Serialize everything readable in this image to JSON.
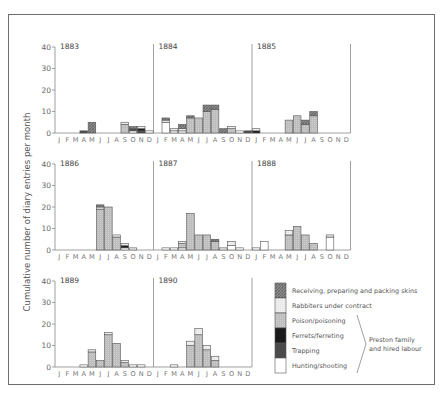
{
  "figure": {
    "ylabel": "Cumulative number of diary entries per month",
    "months": [
      "J",
      "F",
      "M",
      "A",
      "M",
      "J",
      "J",
      "A",
      "S",
      "O",
      "N",
      "D"
    ],
    "yticks": [
      0,
      10,
      20,
      30,
      40
    ]
  },
  "colors": {
    "receiving": "#7a7a7a",
    "rabbiters": "#eeeeee",
    "poison": "#c4c4c4",
    "ferrets": "#1a1a1a",
    "trapping": "#4a4a4a",
    "hunting": "#ffffff",
    "outline": "#555555",
    "axis": "#888888"
  },
  "legend": {
    "items": [
      {
        "key": "receiving",
        "label": "Receiving, preparing and packing skins"
      },
      {
        "key": "rabbiters",
        "label": "Rabbiters under contract"
      },
      {
        "key": "poison",
        "label": "Poison/poisoning"
      },
      {
        "key": "ferrets",
        "label": "Ferrets/ferreting"
      },
      {
        "key": "trapping",
        "label": "Trapping"
      },
      {
        "key": "hunting",
        "label": "Hunting/shooting"
      }
    ],
    "bracket_label_line1": "Preston family",
    "bracket_label_line2": "and hired labour"
  },
  "chart_data": {
    "type": "bar",
    "stacked": true,
    "title": "",
    "xlabel": "",
    "ylabel": "Cumulative number of diary entries per month",
    "ylim": [
      0,
      40
    ],
    "categories": [
      "J",
      "F",
      "M",
      "A",
      "M",
      "J",
      "J",
      "A",
      "S",
      "O",
      "N",
      "D"
    ],
    "series_order": [
      "hunting",
      "trapping",
      "ferrets",
      "poison",
      "rabbiters",
      "receiving"
    ],
    "panels": [
      {
        "year": "1883",
        "data": {
          "hunting": [
            0,
            0,
            0,
            0,
            0,
            0,
            0,
            0,
            0,
            1,
            0,
            1
          ],
          "trapping": [
            0,
            0,
            0,
            1,
            0,
            0,
            0,
            0,
            0,
            1,
            1,
            0
          ],
          "ferrets": [
            0,
            0,
            0,
            0,
            0,
            0,
            0,
            0,
            0,
            0,
            1,
            0
          ],
          "poison": [
            0,
            0,
            0,
            0,
            0,
            0,
            0,
            0,
            4,
            0,
            0,
            0
          ],
          "rabbiters": [
            0,
            0,
            0,
            0,
            0,
            0,
            0,
            0,
            1,
            0,
            1,
            0
          ],
          "receiving": [
            0,
            0,
            0,
            0,
            5,
            0,
            0,
            0,
            0,
            1,
            0,
            0
          ]
        }
      },
      {
        "year": "1884",
        "data": {
          "hunting": [
            0,
            5,
            1,
            1,
            0,
            0,
            0,
            0,
            0,
            0,
            1,
            0
          ],
          "trapping": [
            0,
            0,
            0,
            0,
            0,
            0,
            0,
            0,
            0,
            0,
            0,
            1
          ],
          "ferrets": [
            0,
            0,
            0,
            0,
            0,
            0,
            0,
            0,
            0,
            0,
            0,
            0
          ],
          "poison": [
            0,
            0,
            0,
            0,
            7,
            7,
            10,
            11,
            0,
            2,
            0,
            0
          ],
          "rabbiters": [
            0,
            1,
            1,
            1,
            0,
            0,
            0,
            0,
            0,
            1,
            0,
            0
          ],
          "receiving": [
            0,
            1,
            0,
            2,
            1,
            0,
            3,
            2,
            2,
            0,
            0,
            0
          ]
        }
      },
      {
        "year": "1885",
        "data": {
          "hunting": [
            0,
            0,
            0,
            0,
            0,
            0,
            0,
            0,
            0,
            0,
            0,
            0
          ],
          "trapping": [
            0,
            0,
            0,
            0,
            0,
            0,
            0,
            0,
            0,
            0,
            0,
            0
          ],
          "ferrets": [
            1,
            0,
            0,
            0,
            0,
            0,
            0,
            0,
            0,
            0,
            0,
            0
          ],
          "poison": [
            0,
            0,
            0,
            0,
            6,
            8,
            4,
            8,
            0,
            0,
            0,
            0
          ],
          "rabbiters": [
            1,
            0,
            0,
            0,
            0,
            0,
            0,
            0,
            0,
            0,
            0,
            0
          ],
          "receiving": [
            0,
            0,
            0,
            0,
            0,
            0,
            2,
            2,
            0,
            0,
            0,
            0
          ]
        }
      },
      {
        "year": "1886",
        "data": {
          "hunting": [
            0,
            0,
            0,
            0,
            0,
            0,
            0,
            0,
            1,
            0,
            0,
            0
          ],
          "trapping": [
            0,
            0,
            0,
            0,
            0,
            0,
            0,
            0,
            0,
            0,
            0,
            0
          ],
          "ferrets": [
            0,
            0,
            0,
            0,
            0,
            0,
            0,
            0,
            1,
            0,
            0,
            0
          ],
          "poison": [
            0,
            0,
            0,
            0,
            0,
            19,
            20,
            6,
            0,
            0,
            0,
            0
          ],
          "rabbiters": [
            0,
            0,
            0,
            0,
            0,
            1,
            0,
            1,
            1,
            1,
            0,
            0
          ],
          "receiving": [
            0,
            0,
            0,
            0,
            0,
            1,
            0,
            0,
            0,
            0,
            0,
            0
          ]
        }
      },
      {
        "year": "1887",
        "data": {
          "hunting": [
            0,
            1,
            1,
            1,
            0,
            0,
            0,
            0,
            0,
            2,
            1,
            0
          ],
          "trapping": [
            0,
            0,
            0,
            0,
            0,
            0,
            0,
            0,
            0,
            0,
            0,
            0
          ],
          "ferrets": [
            0,
            0,
            0,
            0,
            0,
            0,
            0,
            0,
            0,
            0,
            0,
            0
          ],
          "poison": [
            0,
            0,
            0,
            2,
            17,
            7,
            7,
            4,
            0,
            0,
            0,
            0
          ],
          "rabbiters": [
            0,
            0,
            0,
            1,
            0,
            0,
            0,
            0,
            1,
            2,
            0,
            0
          ],
          "receiving": [
            0,
            0,
            0,
            0,
            0,
            0,
            0,
            1,
            0,
            0,
            0,
            0
          ]
        }
      },
      {
        "year": "1888",
        "data": {
          "hunting": [
            1,
            4,
            0,
            0,
            0,
            0,
            0,
            0,
            0,
            6,
            0,
            0
          ],
          "trapping": [
            0,
            0,
            0,
            0,
            0,
            0,
            0,
            0,
            0,
            0,
            0,
            0
          ],
          "ferrets": [
            0,
            0,
            0,
            0,
            0,
            0,
            0,
            0,
            0,
            0,
            0,
            0
          ],
          "poison": [
            0,
            0,
            0,
            0,
            7,
            11,
            7,
            3,
            0,
            0,
            0,
            0
          ],
          "rabbiters": [
            0,
            0,
            0,
            0,
            2,
            0,
            0,
            0,
            0,
            1,
            0,
            0
          ],
          "receiving": [
            0,
            0,
            0,
            0,
            0,
            0,
            0,
            0,
            0,
            0,
            0,
            0
          ]
        }
      },
      {
        "year": "1889",
        "data": {
          "hunting": [
            0,
            0,
            0,
            1,
            0,
            0,
            0,
            0,
            0,
            1,
            1,
            0
          ],
          "trapping": [
            0,
            0,
            0,
            0,
            0,
            0,
            0,
            0,
            0,
            0,
            0,
            0
          ],
          "ferrets": [
            0,
            0,
            0,
            0,
            0,
            0,
            0,
            0,
            0,
            0,
            0,
            0
          ],
          "poison": [
            0,
            0,
            0,
            0,
            7,
            3,
            15,
            11,
            2,
            0,
            0,
            0
          ],
          "rabbiters": [
            0,
            0,
            0,
            0,
            1,
            0,
            1,
            0,
            1,
            0,
            0,
            0
          ],
          "receiving": [
            0,
            0,
            0,
            0,
            0,
            0,
            0,
            0,
            0,
            0,
            0,
            0
          ]
        }
      },
      {
        "year": "1890",
        "data": {
          "hunting": [
            0,
            0,
            1,
            0,
            0,
            0,
            0,
            0,
            0,
            0,
            0,
            0
          ],
          "trapping": [
            0,
            0,
            0,
            0,
            0,
            0,
            0,
            0,
            0,
            0,
            0,
            0
          ],
          "ferrets": [
            0,
            0,
            0,
            0,
            0,
            0,
            0,
            0,
            0,
            0,
            0,
            0
          ],
          "poison": [
            0,
            0,
            0,
            0,
            10,
            15,
            8,
            3,
            0,
            0,
            0,
            0
          ],
          "rabbiters": [
            0,
            0,
            0,
            0,
            2,
            3,
            2,
            2,
            0,
            0,
            0,
            0
          ],
          "receiving": [
            0,
            0,
            0,
            0,
            0,
            0,
            0,
            0,
            0,
            0,
            0,
            0
          ]
        }
      }
    ]
  }
}
